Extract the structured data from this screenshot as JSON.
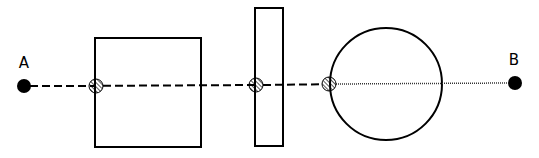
{
  "diagram": {
    "points": [
      {
        "label": "A",
        "x": 24,
        "y": 86
      },
      {
        "label": "B",
        "x": 515,
        "y": 83
      }
    ],
    "shapes": [
      {
        "type": "square",
        "x": 95,
        "y": 38,
        "w": 106,
        "h": 109
      },
      {
        "type": "tall-rectangle",
        "x": 255,
        "y": 8,
        "w": 28,
        "h": 138
      },
      {
        "type": "circle",
        "cx": 386,
        "cy": 84,
        "r": 56
      }
    ],
    "markers": [
      {
        "type": "hatched-circle",
        "x": 96,
        "y": 86
      },
      {
        "type": "hatched-circle",
        "x": 256,
        "y": 85
      },
      {
        "type": "hatched-circle",
        "x": 329,
        "y": 84
      }
    ],
    "segments": [
      {
        "style": "dashed",
        "from": "A",
        "to": "marker-3"
      },
      {
        "style": "dotted",
        "from": "marker-3",
        "to": "B"
      }
    ],
    "colors": {
      "stroke": "#000000",
      "background": "#ffffff"
    }
  }
}
